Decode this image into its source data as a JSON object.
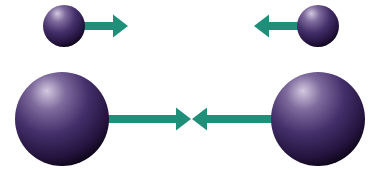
{
  "diagram": {
    "colors": {
      "background": "#ffffff",
      "arrow": "#1f8f7a",
      "sphere_highlight": "#c9bfd8",
      "sphere_mid": "#4a3770",
      "sphere_dark": "#140a24"
    },
    "spheres": [
      {
        "id": "small-left",
        "cx": 64,
        "cy": 26,
        "r": 21
      },
      {
        "id": "small-right",
        "cx": 318,
        "cy": 26,
        "r": 21
      },
      {
        "id": "large-left",
        "cx": 62,
        "cy": 119,
        "r": 47
      },
      {
        "id": "large-right",
        "cx": 318,
        "cy": 119,
        "r": 47
      }
    ],
    "arrows": [
      {
        "id": "small-left-arrow",
        "direction": "right",
        "from_x": 84,
        "to_x": 128,
        "y": 26
      },
      {
        "id": "small-right-arrow",
        "direction": "left",
        "from_x": 298,
        "to_x": 254,
        "y": 26
      },
      {
        "id": "large-left-arrow",
        "direction": "right",
        "from_x": 108,
        "to_x": 191,
        "y": 119
      },
      {
        "id": "large-right-arrow",
        "direction": "left",
        "from_x": 272,
        "to_x": 192,
        "y": 119
      }
    ]
  }
}
